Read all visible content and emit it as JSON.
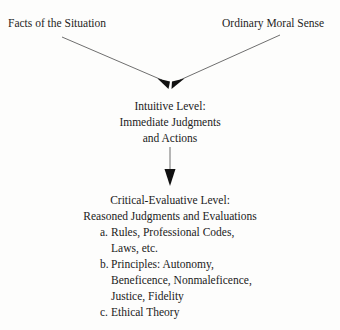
{
  "diagram": {
    "background_color": "#fdfdfc",
    "text_color": "#1f1d1c",
    "line_color": "#6f6f6f",
    "arrowhead_color": "#111111",
    "sources": [
      {
        "label": "Facts of the Situation"
      },
      {
        "label": "Ordinary Moral Sense"
      }
    ],
    "intuitive_level": {
      "lines": [
        "Intuitive Level:",
        "Immediate Judgments",
        "and Actions"
      ]
    },
    "critical_level": {
      "lines": [
        "Critical-Evaluative Level:",
        "Reasoned Judgments and Evaluations"
      ],
      "items": [
        {
          "marker": "a.",
          "text": "Rules, Professional Codes,",
          "continuation": "Laws, etc."
        },
        {
          "marker": "b.",
          "text": "Principles: Autonomy,",
          "continuation": "Beneficence, Nonmaleficence,",
          "continuation2": "Justice, Fidelity"
        },
        {
          "marker": "c.",
          "text": "Ethical Theory",
          "continuation": ""
        }
      ]
    },
    "connectors": [
      {
        "name": "facts-to-intuitive",
        "from": "Facts of the Situation",
        "to": "Intuitive Level"
      },
      {
        "name": "moral-sense-to-intuitive",
        "from": "Ordinary Moral Sense",
        "to": "Intuitive Level"
      },
      {
        "name": "intuitive-to-critical",
        "from": "Intuitive Level",
        "to": "Critical-Evaluative Level"
      }
    ]
  }
}
